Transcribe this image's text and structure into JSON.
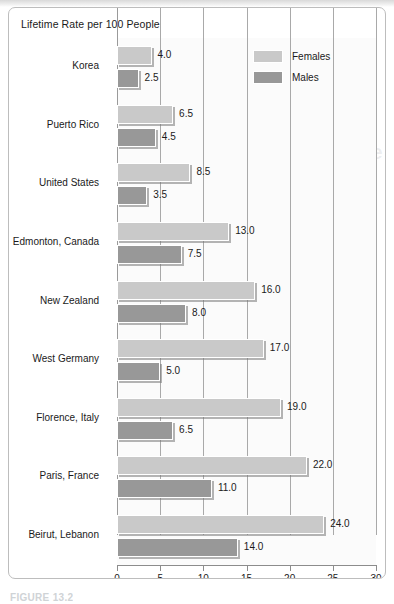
{
  "figure": {
    "title": "Lifetime Rate per 100 People",
    "caption": "FIGURE 13.2"
  },
  "legend": {
    "position": "top-right",
    "items": [
      {
        "label": "Females",
        "color": "#c9c9c9",
        "name": "legend-females"
      },
      {
        "label": "Males",
        "color": "#989898",
        "name": "legend-males"
      }
    ]
  },
  "axis": {
    "ticks": [
      "0",
      "5",
      "10",
      "15",
      "20",
      "25",
      "30"
    ]
  },
  "chart_data": {
    "type": "bar",
    "orientation": "horizontal",
    "title": "Lifetime Rate per 100 People",
    "xlabel": "",
    "ylabel": "",
    "xlim": [
      0,
      30
    ],
    "xticks": [
      0,
      5,
      10,
      15,
      20,
      25,
      30
    ],
    "grid": true,
    "legend_position": "top-right",
    "categories": [
      "Korea",
      "Puerto Rico",
      "United States",
      "Edmonton, Canada",
      "New Zealand",
      "West Germany",
      "Florence, Italy",
      "Paris, France",
      "Beirut, Lebanon"
    ],
    "series": [
      {
        "name": "Females",
        "color": "#c9c9c9",
        "values": [
          4.0,
          6.5,
          8.5,
          13.0,
          16.0,
          17.0,
          19.0,
          22.0,
          24.0
        ],
        "labels": [
          "4.0",
          "6.5",
          "8.5",
          "13.0",
          "16.0",
          "17.0",
          "19.0",
          "22.0",
          "24.0"
        ]
      },
      {
        "name": "Males",
        "color": "#989898",
        "values": [
          2.5,
          4.5,
          3.5,
          7.5,
          8.0,
          5.0,
          6.5,
          11.0,
          14.0
        ],
        "labels": [
          "2.5",
          "4.5",
          "3.5",
          "7.5",
          "8.0",
          "5.0",
          "6.5",
          "11.0",
          "14.0"
        ]
      }
    ]
  },
  "bleed": {
    "title_line1": "linical and Developm",
    "title_line2": "an Kids “Catch” Depre",
    "body": [
      "hoice of individuals",
      "d of depression",
      "ing parental depression",
      "epressed mother with",
      "en 2007). Thus, women",
      "ition for children of",
      "rs. Recent studies have",
      "d with mood disorders,",
      "epression",
      "ous factors",
      "on, 2006)."
    ]
  }
}
